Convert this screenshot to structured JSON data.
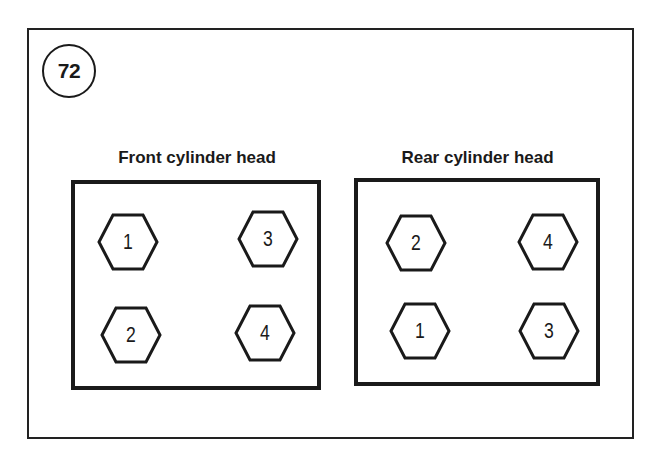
{
  "figure_number": "72",
  "diagrams": [
    {
      "title": "Front cylinder head",
      "bolts": [
        {
          "label": "1",
          "position": "top-left"
        },
        {
          "label": "3",
          "position": "top-right"
        },
        {
          "label": "2",
          "position": "bottom-left"
        },
        {
          "label": "4",
          "position": "bottom-right"
        }
      ]
    },
    {
      "title": "Rear cylinder head",
      "bolts": [
        {
          "label": "2",
          "position": "top-left"
        },
        {
          "label": "4",
          "position": "top-right"
        },
        {
          "label": "1",
          "position": "bottom-left"
        },
        {
          "label": "3",
          "position": "bottom-right"
        }
      ]
    }
  ]
}
